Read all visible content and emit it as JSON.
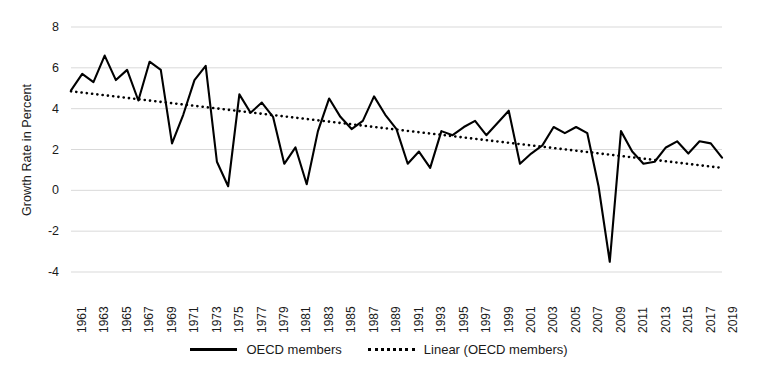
{
  "chart_data": {
    "type": "line",
    "title": "",
    "xlabel": "",
    "ylabel": "Growth Rate in Percent",
    "ylim": [
      -4,
      8
    ],
    "xlim": [
      1961,
      2019
    ],
    "y_ticks": [
      8,
      6,
      4,
      2,
      0,
      -2,
      -4
    ],
    "y_tick_labels": [
      "8",
      "6",
      "4",
      "2",
      "0",
      "-2",
      "-4"
    ],
    "x_tick_labels": [
      "1961",
      "1963",
      "1965",
      "1967",
      "1969",
      "1971",
      "1973",
      "1975",
      "1977",
      "1979",
      "1981",
      "1983",
      "1985",
      "1987",
      "1989",
      "1991",
      "1993",
      "1995",
      "1997",
      "1999",
      "2001",
      "2003",
      "2005",
      "2007",
      "2009",
      "2011",
      "2013",
      "2015",
      "2017",
      "2019"
    ],
    "x_tick_rotation": -90,
    "grid": "horizontal",
    "legend_position": "bottom",
    "x": [
      1961,
      1962,
      1963,
      1964,
      1965,
      1966,
      1967,
      1968,
      1969,
      1970,
      1971,
      1972,
      1973,
      1974,
      1975,
      1976,
      1977,
      1978,
      1979,
      1980,
      1981,
      1982,
      1983,
      1984,
      1985,
      1986,
      1987,
      1988,
      1989,
      1990,
      1991,
      1992,
      1993,
      1994,
      1995,
      1996,
      1997,
      1998,
      1999,
      2000,
      2001,
      2002,
      2003,
      2004,
      2005,
      2006,
      2007,
      2008,
      2009,
      2010,
      2011,
      2012,
      2013,
      2014,
      2015,
      2016,
      2017,
      2018,
      2019
    ],
    "series": [
      {
        "name": "OECD members",
        "style": "solid",
        "color": "#000000",
        "values": [
          4.9,
          5.7,
          5.3,
          6.6,
          5.4,
          5.9,
          4.4,
          6.3,
          5.9,
          2.3,
          3.7,
          5.4,
          6.1,
          1.4,
          0.2,
          4.7,
          3.8,
          4.3,
          3.6,
          1.3,
          2.1,
          0.3,
          2.9,
          4.5,
          3.6,
          3.0,
          3.4,
          4.6,
          3.7,
          3.0,
          1.3,
          1.9,
          1.1,
          2.9,
          2.7,
          3.1,
          3.4,
          2.7,
          3.3,
          3.9,
          1.3,
          1.8,
          2.2,
          3.1,
          2.8,
          3.1,
          2.8,
          0.2,
          -3.5,
          2.9,
          1.9,
          1.3,
          1.4,
          2.1,
          2.4,
          1.8,
          2.4,
          2.3,
          1.6
        ]
      },
      {
        "name": "Linear (OECD members)",
        "style": "dotted",
        "color": "#000000",
        "trend_start": 4.85,
        "trend_end": 1.1
      }
    ],
    "legend": [
      {
        "label": "OECD members",
        "style": "solid"
      },
      {
        "label": "Linear (OECD members)",
        "style": "dotted"
      }
    ]
  }
}
